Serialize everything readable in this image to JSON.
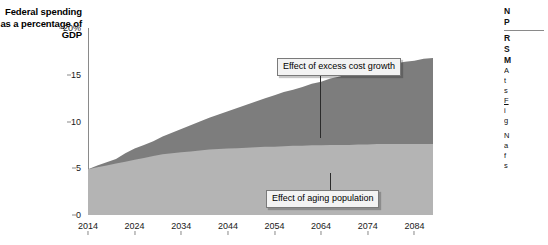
{
  "chart_data": {
    "type": "area",
    "stacked": true,
    "title": "",
    "ylabel": "Federal spending as a percentage of GDP",
    "xlabel": "",
    "ylim": [
      0,
      20
    ],
    "xlim": [
      2014,
      2088
    ],
    "grid": false,
    "legend_position": "none",
    "ytick_labels": [
      "0",
      "5",
      "10",
      "15",
      "20%"
    ],
    "ytick_values": [
      0,
      5,
      10,
      15,
      20
    ],
    "xtick_labels": [
      "2014",
      "2024",
      "2034",
      "2044",
      "2054",
      "2064",
      "2074",
      "2084"
    ],
    "xtick_values": [
      2014,
      2024,
      2034,
      2044,
      2054,
      2064,
      2074,
      2084
    ],
    "x": [
      2014,
      2016,
      2018,
      2020,
      2022,
      2024,
      2026,
      2028,
      2030,
      2032,
      2034,
      2036,
      2038,
      2040,
      2042,
      2044,
      2046,
      2048,
      2050,
      2052,
      2054,
      2056,
      2058,
      2060,
      2062,
      2064,
      2066,
      2068,
      2070,
      2072,
      2074,
      2076,
      2078,
      2080,
      2082,
      2084,
      2086,
      2088
    ],
    "series": [
      {
        "name": "Effect of aging population",
        "color": "#b4b4b4",
        "values": [
          4.9,
          5.1,
          5.3,
          5.5,
          5.7,
          5.9,
          6.1,
          6.3,
          6.5,
          6.6,
          6.7,
          6.8,
          6.9,
          7.0,
          7.05,
          7.1,
          7.15,
          7.2,
          7.25,
          7.3,
          7.3,
          7.35,
          7.4,
          7.4,
          7.45,
          7.45,
          7.5,
          7.5,
          7.5,
          7.55,
          7.55,
          7.6,
          7.6,
          7.6,
          7.6,
          7.6,
          7.6,
          7.6
        ]
      },
      {
        "name": "Effect of excess cost growth",
        "color": "#7d7d7d",
        "values": [
          0.0,
          0.2,
          0.35,
          0.5,
          0.9,
          1.2,
          1.4,
          1.6,
          1.9,
          2.2,
          2.5,
          2.8,
          3.1,
          3.4,
          3.7,
          4.0,
          4.3,
          4.6,
          4.9,
          5.2,
          5.5,
          5.8,
          6.0,
          6.3,
          6.6,
          6.8,
          7.1,
          7.3,
          7.6,
          7.8,
          8.0,
          8.2,
          8.4,
          8.6,
          8.8,
          8.9,
          9.1,
          9.2
        ]
      }
    ],
    "totals": [
      4.9,
      5.3,
      5.65,
      6.0,
      6.6,
      7.1,
      7.5,
      7.9,
      8.4,
      8.8,
      9.2,
      9.6,
      10.0,
      10.4,
      10.75,
      11.1,
      11.45,
      11.8,
      12.15,
      12.5,
      12.8,
      13.15,
      13.4,
      13.7,
      14.05,
      14.25,
      14.6,
      14.8,
      15.1,
      15.35,
      15.55,
      15.8,
      16.0,
      16.2,
      16.4,
      16.5,
      16.7,
      16.8
    ],
    "annotations": [
      {
        "id": "excess",
        "text": "Effect of excess cost growth",
        "points_to": "dark-band"
      },
      {
        "id": "aging",
        "text": "Effect of aging population",
        "points_to": "light-band"
      }
    ]
  },
  "side_column": {
    "heading_line_1": "N",
    "heading_line_2": "P",
    "subheading_line_1": "R",
    "subheading_line_2": "S",
    "subheading_line_3": "M",
    "body_line_1": "A",
    "body_line_2": "t",
    "body_line_3": "s",
    "body_line_4": "F",
    "body_line_5": "i",
    "body_line_6": "g",
    "body_line_7": "N",
    "body_line_8": "a",
    "body_line_9": "f",
    "body_line_10": "s"
  }
}
